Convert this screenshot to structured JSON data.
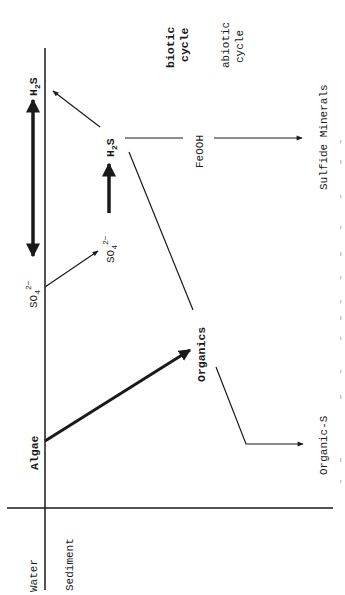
{
  "diagram": {
    "orientation": "rotated 90 degrees counter-clockwise (text reads bottom-to-top)",
    "legend": {
      "biotic_label_line1": "biotic",
      "biotic_label_line2": "cycle",
      "abiotic_label_line1": "abiotic",
      "abiotic_label_line2": "cycle"
    },
    "compartments": {
      "water": "Water",
      "sediment": "Sediment"
    },
    "nodes": {
      "algae": "Algae",
      "organics": "Organics",
      "h2s_water": {
        "base": "H",
        "sub": "2",
        "tail": "S"
      },
      "h2s_sediment": {
        "base": "H",
        "sub": "2",
        "tail": "S"
      },
      "so4_water": {
        "base": "SO",
        "sub": "4",
        "sup": "2−"
      },
      "so4_sediment": {
        "base": "SO",
        "sub": "4",
        "sup": "2−"
      },
      "feooh": "FeOOH",
      "sulfide_minerals": "Sulfide Minerals",
      "organic_s": "Organic-S"
    },
    "edges": [
      {
        "from": "Algae",
        "to": "Organics",
        "type": "biotic",
        "style": "bold arrow"
      },
      {
        "from": "Organics",
        "to": "H2S (sediment)",
        "type": "abiotic",
        "style": "thin line"
      },
      {
        "from": "Organics",
        "to": "Organic-S",
        "type": "abiotic",
        "style": "thin arrow"
      },
      {
        "from": "SO4 2- (sediment)",
        "to": "H2S (sediment)",
        "type": "biotic",
        "style": "bold arrow"
      },
      {
        "from": "SO4 2- (water)",
        "to": "SO4 2- (sediment)",
        "type": "abiotic",
        "style": "thin arrow"
      },
      {
        "from": "H2S (sediment)",
        "to": "H2S (water)",
        "type": "abiotic",
        "style": "thin arrow"
      },
      {
        "from": "H2S (sediment)",
        "to": "Sulfide Minerals",
        "via": "FeOOH",
        "type": "abiotic",
        "style": "thin arrow"
      },
      {
        "from": "H2S (water)",
        "to": "SO4 2- (water)",
        "type": "biotic",
        "style": "bold double-headed arrow"
      }
    ],
    "caption_partial": "Figure ... (faint, cut off at right edge)"
  },
  "colors": {
    "ink": "#1a1a1a",
    "background": "#ffffff",
    "caption": "#b8b8b8"
  }
}
